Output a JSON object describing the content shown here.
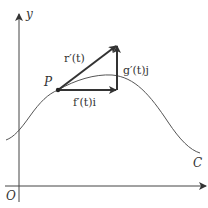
{
  "figure": {
    "axes": {
      "x_label": "x",
      "y_label": "y",
      "origin_label": "O"
    },
    "curve_label": "C",
    "point_label": "P",
    "vectors": {
      "tangent": "r′(t)",
      "horizontal": "f′(t)i",
      "vertical": "g′(t)j"
    },
    "colors": {
      "stroke": "#333333",
      "curve": "#555555",
      "background": "#ffffff"
    }
  }
}
